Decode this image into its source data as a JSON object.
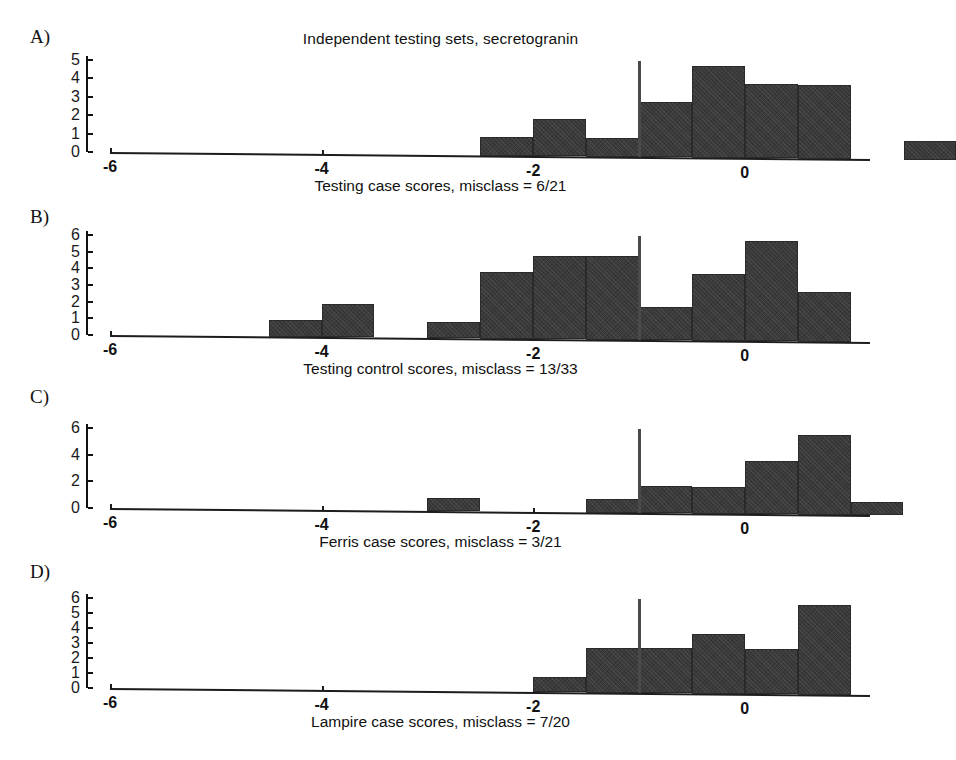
{
  "figure": {
    "title": "Independent testing sets, secretogranin",
    "bar_color": "#3a3a3a",
    "threshold_color": "#4a4a4a",
    "axis_color": "#1d1d1d"
  },
  "panels": [
    {
      "label": "A)",
      "caption": "Testing case scores, misclass = 6/21",
      "chart_data": {
        "type": "bar",
        "title": "Independent testing sets, secretogranin",
        "xlabel": "Testing case scores, misclass = 6/21",
        "ylabel": "",
        "xlim": [
          -6.4,
          1.3
        ],
        "ylim": [
          0,
          5
        ],
        "grid": false,
        "xticks": [
          -6,
          -4,
          -2,
          0
        ],
        "xticklabels": [
          "-6",
          "-4",
          "-2",
          "0"
        ],
        "yticks": [
          0,
          1,
          2,
          3,
          4,
          5
        ],
        "yticklabels": [
          "0",
          "1",
          "2",
          "3",
          "4",
          "5"
        ],
        "bin_width": 0.5,
        "threshold": -1.0,
        "bins": [
          {
            "left": -2.5,
            "right": -2.0,
            "value": 1
          },
          {
            "left": -2.0,
            "right": -1.5,
            "value": 2
          },
          {
            "left": -1.5,
            "right": -1.0,
            "value": 1
          },
          {
            "left": -1.0,
            "right": -0.5,
            "value": 3
          },
          {
            "left": -0.5,
            "right": 0.0,
            "value": 5
          },
          {
            "left": 0.0,
            "right": 0.5,
            "value": 4
          },
          {
            "left": 0.5,
            "right": 1.0,
            "value": 4
          },
          {
            "left": 1.5,
            "right": 2.0,
            "value": 1
          }
        ]
      }
    },
    {
      "label": "B)",
      "caption": "Testing control scores, misclass = 13/33",
      "chart_data": {
        "type": "bar",
        "title": "",
        "xlabel": "Testing control scores, misclass = 13/33",
        "ylabel": "",
        "xlim": [
          -6.4,
          1.3
        ],
        "ylim": [
          0,
          6
        ],
        "grid": false,
        "xticks": [
          -6,
          -4,
          -2,
          0
        ],
        "xticklabels": [
          "-6",
          "-4",
          "-2",
          "0"
        ],
        "yticks": [
          0,
          1,
          2,
          3,
          4,
          5,
          6
        ],
        "yticklabels": [
          "0",
          "1",
          "2",
          "3",
          "4",
          "5",
          "6"
        ],
        "bin_width": 0.5,
        "threshold": -1.0,
        "bins": [
          {
            "left": -4.5,
            "right": -4.0,
            "value": 1
          },
          {
            "left": -4.0,
            "right": -3.5,
            "value": 2
          },
          {
            "left": -3.0,
            "right": -2.5,
            "value": 1
          },
          {
            "left": -2.5,
            "right": -2.0,
            "value": 4
          },
          {
            "left": -2.0,
            "right": -1.5,
            "value": 5
          },
          {
            "left": -1.5,
            "right": -1.0,
            "value": 5
          },
          {
            "left": -1.0,
            "right": -0.5,
            "value": 2
          },
          {
            "left": -0.5,
            "right": 0.0,
            "value": 4
          },
          {
            "left": 0.0,
            "right": 0.5,
            "value": 6
          },
          {
            "left": 0.5,
            "right": 1.0,
            "value": 3
          }
        ]
      }
    },
    {
      "label": "C)",
      "caption": "Ferris case scores, misclass = 3/21",
      "chart_data": {
        "type": "bar",
        "title": "",
        "xlabel": "Ferris case scores, misclass = 3/21",
        "ylabel": "",
        "xlim": [
          -6.4,
          1.3
        ],
        "ylim": [
          0,
          6
        ],
        "grid": false,
        "xticks": [
          -6,
          -4,
          -2,
          0
        ],
        "xticklabels": [
          "-6",
          "-4",
          "-2",
          "0"
        ],
        "yticks": [
          0,
          2,
          4,
          6
        ],
        "yticklabels": [
          "0",
          "2",
          "4",
          "6"
        ],
        "bin_width": 0.5,
        "threshold": -1.0,
        "bins": [
          {
            "left": -3.0,
            "right": -2.5,
            "value": 1
          },
          {
            "left": -1.5,
            "right": -1.0,
            "value": 1
          },
          {
            "left": -1.0,
            "right": -0.5,
            "value": 2
          },
          {
            "left": -0.5,
            "right": 0.0,
            "value": 2
          },
          {
            "left": 0.0,
            "right": 0.5,
            "value": 4
          },
          {
            "left": 0.5,
            "right": 1.0,
            "value": 6
          },
          {
            "left": 1.0,
            "right": 1.5,
            "value": 1
          }
        ]
      }
    },
    {
      "label": "D)",
      "caption": "Lampire case scores, misclass = 7/20",
      "chart_data": {
        "type": "bar",
        "title": "",
        "xlabel": "Lampire case scores, misclass = 7/20",
        "ylabel": "",
        "xlim": [
          -6.4,
          1.3
        ],
        "ylim": [
          0,
          6
        ],
        "grid": false,
        "xticks": [
          -6,
          -4,
          -2,
          0
        ],
        "xticklabels": [
          "-6",
          "-4",
          "-2",
          "0"
        ],
        "yticks": [
          0,
          1,
          2,
          3,
          4,
          5,
          6
        ],
        "yticklabels": [
          "0",
          "1",
          "2",
          "3",
          "4",
          "5",
          "6"
        ],
        "bin_width": 0.5,
        "threshold": -1.0,
        "bins": [
          {
            "left": -2.0,
            "right": -1.5,
            "value": 1
          },
          {
            "left": -1.5,
            "right": -1.0,
            "value": 3
          },
          {
            "left": -1.0,
            "right": -0.5,
            "value": 3
          },
          {
            "left": -0.5,
            "right": 0.0,
            "value": 4
          },
          {
            "left": 0.0,
            "right": 0.5,
            "value": 3
          },
          {
            "left": 0.5,
            "right": 1.0,
            "value": 6
          }
        ]
      }
    }
  ]
}
